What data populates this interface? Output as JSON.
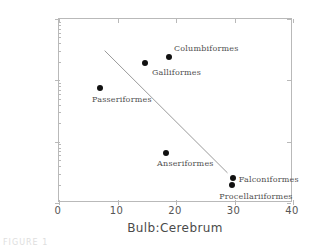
{
  "figure": {
    "caption": "FIGURE 1"
  },
  "chart_data": {
    "type": "scatter",
    "title": "",
    "xlabel": "Bulb:Cerebrum",
    "ylabel": "Detection Threshold (ppm",
    "xlim": [
      0,
      40
    ],
    "ylim": [
      0.01,
      10
    ],
    "yscale": "log",
    "xscale": "linear",
    "grid": false,
    "legend": "none",
    "xticks": [
      "0",
      "10",
      "20",
      "30",
      "40"
    ],
    "xtick_values": [
      0,
      10,
      20,
      30,
      40
    ],
    "yticks": [
      "10",
      "1",
      "0.1",
      "0.01"
    ],
    "ytick_values": [
      10,
      1,
      0.1,
      0.01
    ],
    "points": [
      {
        "label": "Passeriformes",
        "x": 7.0,
        "y": 0.75,
        "label_dx": -8,
        "label_dy": 11
      },
      {
        "label": "Galliformes",
        "x": 14.7,
        "y": 1.9,
        "label_dx": 7,
        "label_dy": 9
      },
      {
        "label": "Columbiformes",
        "x": 18.8,
        "y": 2.4,
        "label_dx": 5,
        "label_dy": -9
      },
      {
        "label": "Anseriformes",
        "x": 18.3,
        "y": 0.066,
        "label_dx": -9,
        "label_dy": 10
      },
      {
        "label": "Falconiformes",
        "x": 29.7,
        "y": 0.026,
        "label_dx": 6,
        "label_dy": 1
      },
      {
        "label": "Procellariiformes",
        "x": 29.6,
        "y": 0.02,
        "label_dx": -13,
        "label_dy": 11
      }
    ],
    "trend_line": {
      "x_start": 7.8,
      "y_start": 3.05,
      "x_end": 28.8,
      "y_end": 0.031,
      "color": "#9a9a9a"
    }
  }
}
